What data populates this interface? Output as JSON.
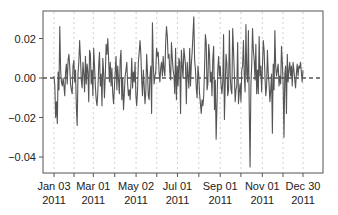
{
  "chart_data": {
    "type": "line",
    "title": "",
    "xlabel": "",
    "ylabel": "",
    "ylim": [
      -0.048,
      0.034
    ],
    "grid": {
      "x": true,
      "y": false,
      "style": "dotted",
      "color": "#cfcfcf"
    },
    "legend": null,
    "x_ticks": [
      {
        "label_line1": "Jan 03",
        "label_line2": "2011",
        "day": 0
      },
      {
        "label_line1": "Mar 01",
        "label_line2": "2011",
        "day": 57
      },
      {
        "label_line1": "May 02",
        "label_line2": "2011",
        "day": 119
      },
      {
        "label_line1": "Jul 01",
        "label_line2": "2011",
        "day": 179
      },
      {
        "label_line1": "Sep 01",
        "label_line2": "2011",
        "day": 241
      },
      {
        "label_line1": "Nov 01",
        "label_line2": "2011",
        "day": 302
      },
      {
        "label_line1": "Dec 30",
        "label_line2": "2011",
        "day": 361
      }
    ],
    "minor_tick_days": [
      0,
      29,
      57,
      88,
      119,
      149,
      179,
      210,
      241,
      271,
      302,
      332,
      361
    ],
    "y_ticks": [
      {
        "label": "0.02",
        "value": 0.02
      },
      {
        "label": "0.00",
        "value": 0.0
      },
      {
        "label": "−0.02",
        "value": -0.02
      },
      {
        "label": "−0.04",
        "value": -0.04
      }
    ],
    "reference_line": {
      "value": 0.0,
      "style": "dashed",
      "color": "#555555"
    },
    "series": [
      {
        "name": "daily returns 2011",
        "color": "#555555",
        "values": [
          0.001,
          -0.004,
          -0.02,
          -0.012,
          -0.023,
          0.003,
          -0.006,
          0.026,
          0.004,
          -0.002,
          -0.004,
          0.0,
          -0.004,
          -0.009,
          0.003,
          0.007,
          -0.003,
          0.009,
          0.012,
          0.006,
          -0.003,
          -0.006,
          -0.008,
          0.006,
          0.009,
          -0.002,
          0.004,
          -0.014,
          -0.024,
          0.002,
          0.008,
          0.019,
          0.01,
          -0.001,
          -0.005,
          0.008,
          0.002,
          -0.007,
          0.011,
          -0.003,
          0.007,
          0.003,
          -0.012,
          0.014,
          0.012,
          -0.003,
          0.004,
          -0.009,
          0.015,
          0.006,
          -0.004,
          -0.011,
          -0.014,
          -0.007,
          0.006,
          0.013,
          -0.004,
          0.002,
          -0.014,
          0.01,
          0.003,
          -0.01,
          0.001,
          0.017,
          0.012,
          0.02,
          0.01,
          -0.002,
          0.008,
          -0.004,
          0.005,
          -0.008,
          -0.013,
          -0.005,
          0.003,
          0.011,
          -0.006,
          0.006,
          -0.001,
          -0.008,
          0.009,
          0.014,
          -0.011,
          0.0,
          -0.016,
          -0.008,
          0.001,
          0.004,
          0.008,
          -0.003,
          -0.009,
          -0.006,
          -0.011,
          -0.003,
          0.01,
          -0.005,
          0.003,
          -0.002,
          0.008,
          -0.009,
          -0.014,
          -0.006,
          0.008,
          0.013,
          0.019,
          0.012,
          -0.001,
          -0.009,
          0.004,
          -0.004,
          -0.013,
          -0.007,
          0.012,
          0.003,
          -0.009,
          -0.011,
          0.001,
          0.006,
          -0.018,
          0.028,
          0.007,
          -0.003,
          0.001,
          0.003,
          0.015,
          0.011,
          0.013,
          0.003,
          -0.002,
          0.005,
          0.008,
          0.001,
          0.011,
          0.004,
          0.001,
          0.018,
          0.026,
          0.021,
          0.01,
          0.012,
          0.003,
          -0.001,
          0.018,
          0.01,
          0.004,
          0.001,
          -0.008,
          0.015,
          -0.011,
          0.006,
          -0.004,
          0.01,
          0.008,
          -0.018,
          0.014,
          0.006,
          0.0,
          0.015,
          0.011,
          0.006,
          -0.013,
          0.008,
          0.001,
          -0.005,
          0.015,
          -0.004,
          0.007,
          0.013,
          0.022,
          0.031,
          0.009,
          0.004,
          -0.005,
          -0.01,
          0.006,
          0.001,
          -0.008,
          -0.013,
          -0.018,
          -0.011,
          -0.014,
          -0.009,
          0.005,
          0.022,
          0.018,
          -0.006,
          -0.003,
          0.017,
          0.012,
          -0.002,
          0.003,
          -0.009,
          0.01,
          0.016,
          -0.016,
          -0.001,
          -0.031,
          -0.014,
          0.004,
          0.011,
          0.001,
          0.006,
          -0.004,
          -0.008,
          -0.002,
          0.022,
          -0.021,
          -0.003,
          0.012,
          0.007,
          -0.009,
          -0.006,
          0.024,
          0.001,
          -0.006,
          -0.008,
          0.025,
          0.014,
          0.002,
          -0.012,
          -0.006,
          -0.004,
          0.018,
          -0.013,
          -0.007,
          -0.003,
          -0.012,
          0.004,
          0.006,
          0.019,
          0.001,
          -0.007,
          0.027,
          0.002,
          -0.002,
          0.024,
          -0.015,
          -0.045,
          -0.004,
          0.007,
          0.025,
          0.014,
          0.009,
          -0.001,
          0.017,
          -0.008,
          0.004,
          -0.008,
          0.021,
          0.001,
          0.006,
          -0.007,
          0.006,
          0.019,
          0.014,
          0.001,
          -0.009,
          -0.004,
          0.014,
          0.002,
          -0.003,
          -0.012,
          -0.006,
          0.002,
          -0.028,
          0.007,
          -0.006,
          0.024,
          0.006,
          0.001,
          0.004,
          0.007,
          -0.004,
          0.001,
          -0.003,
          0.016,
          0.008,
          -0.003,
          -0.03,
          0.002,
          0.006,
          -0.018,
          0.012,
          -0.002,
          0.004,
          0.008,
          0.001,
          0.006,
          -0.004,
          0.008,
          0.004,
          -0.001,
          -0.005,
          0.002,
          0.007,
          0.001,
          0.006,
          0.005,
          0.008,
          0.003,
          -0.002,
          0.004
        ]
      }
    ]
  },
  "colors": {
    "line": "#555555",
    "frame": "#555555",
    "grid": "#d0d0d0",
    "zero_line": "#555555",
    "text": "#222222"
  }
}
